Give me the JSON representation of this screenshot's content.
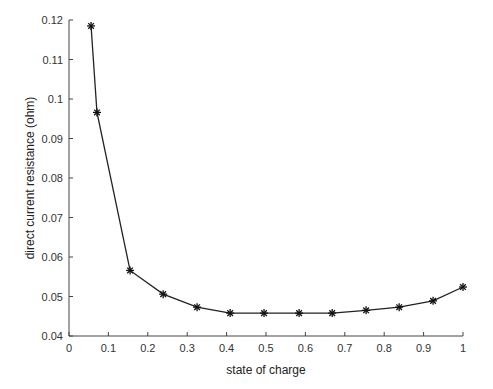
{
  "chart_data": {
    "type": "line",
    "title": "",
    "xlabel": "state of charge",
    "ylabel": "direct current resistance (ohm)",
    "xlim": [
      0,
      1
    ],
    "ylim": [
      0.04,
      0.12
    ],
    "xticks": [
      "0",
      "0.1",
      "0.2",
      "0.3",
      "0.4",
      "0.5",
      "0.6",
      "0.7",
      "0.8",
      "0.9",
      "1"
    ],
    "yticks": [
      "0.04",
      "0.05",
      "0.06",
      "0.07",
      "0.08",
      "0.09",
      "0.1",
      "0.11",
      "0.12"
    ],
    "grid": false,
    "legend": null,
    "marker": "asterisk",
    "line_color": "#222222",
    "series": [
      {
        "name": "DC resistance",
        "x": [
          0.056,
          0.071,
          0.155,
          0.239,
          0.325,
          0.409,
          0.495,
          0.584,
          0.668,
          0.754,
          0.838,
          0.924,
          1.0
        ],
        "y": [
          0.1185,
          0.0966,
          0.0566,
          0.0506,
          0.0473,
          0.0458,
          0.0458,
          0.0458,
          0.0458,
          0.0465,
          0.0473,
          0.0489,
          0.0524
        ]
      }
    ]
  }
}
